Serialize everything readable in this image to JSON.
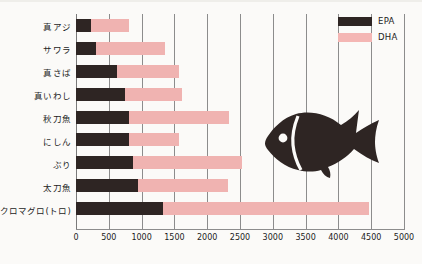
{
  "chart_data": {
    "type": "bar",
    "orientation": "horizontal",
    "stacked": true,
    "title": "",
    "xlabel": "",
    "ylabel": "",
    "xlim": [
      0,
      5000
    ],
    "grid": true,
    "legend_position": "top-right",
    "categories": [
      "真アジ",
      "サワラ",
      "真さば",
      "真いわし",
      "秋刀魚",
      "にしん",
      "ぶり",
      "太刀魚",
      "クロマグロ(トロ)"
    ],
    "xticks": [
      0,
      500,
      1000,
      1500,
      2000,
      2500,
      3000,
      3500,
      4000,
      4500,
      5000
    ],
    "xtick_labels": [
      "0",
      "500",
      "1000",
      "1500",
      "2000",
      "2500",
      "3000",
      "3500",
      "4000",
      "4500",
      "5000"
    ],
    "series": [
      {
        "name": "EPA",
        "color": "#2e2523",
        "values": [
          230,
          300,
          620,
          750,
          810,
          810,
          870,
          940,
          1330
        ]
      },
      {
        "name": "DHA",
        "color": "#f0b3b1",
        "values": [
          580,
          1050,
          950,
          870,
          1520,
          760,
          1660,
          1370,
          3130
        ]
      }
    ],
    "totals": [
      810,
      1350,
      1570,
      1620,
      2330,
      1570,
      2530,
      2310,
      4460
    ]
  },
  "legend": {
    "items": [
      {
        "label": "EPA",
        "color": "#2e2523"
      },
      {
        "label": "DHA",
        "color": "#f4b6b4"
      }
    ]
  },
  "illustration": {
    "name": "fish-silhouette",
    "color": "#2e2523"
  }
}
